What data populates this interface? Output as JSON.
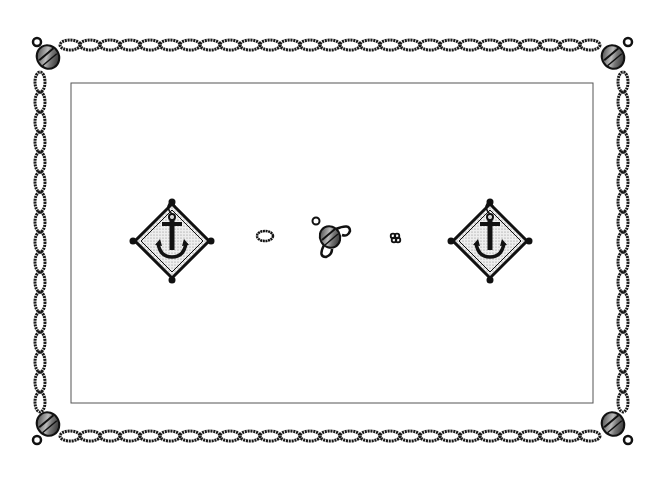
{
  "canvas": {
    "width": 661,
    "height": 478,
    "background": "#ffffff"
  },
  "border": {
    "style": "twisted-rope",
    "color": "#1a1a1a",
    "top_y": 45,
    "bottom_y": 436,
    "left_x": 40,
    "right_x": 623,
    "link_period": 20
  },
  "inner_frame": {
    "x": 71,
    "y": 83,
    "width": 522,
    "height": 320,
    "stroke": "#555555"
  },
  "corners": [
    {
      "name": "top-left",
      "x": 48,
      "y": 57,
      "ring": [
        37,
        42
      ]
    },
    {
      "name": "top-right",
      "x": 613,
      "y": 57,
      "ring": [
        628,
        42
      ]
    },
    {
      "name": "bottom-left",
      "x": 48,
      "y": 424,
      "ring": [
        37,
        440
      ]
    },
    {
      "name": "bottom-right",
      "x": 613,
      "y": 424,
      "ring": [
        628,
        440
      ]
    }
  ],
  "motifs": {
    "anchor_left": {
      "cx": 172,
      "cy": 241
    },
    "ring": {
      "cx": 265,
      "cy": 236
    },
    "buoy": {
      "cx": 330,
      "cy": 237
    },
    "knot": {
      "cx": 395,
      "cy": 238
    },
    "anchor_right": {
      "cx": 490,
      "cy": 241
    }
  }
}
